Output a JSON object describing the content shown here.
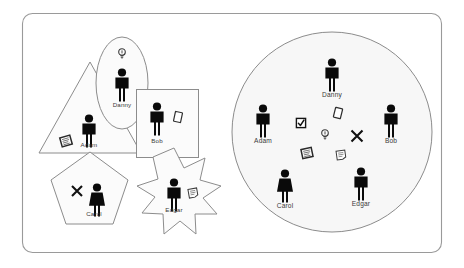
{
  "diagram": {
    "title": "",
    "type": "before-after-collaboration-diagram",
    "frame": {
      "shape": "rounded-rectangle",
      "stroke_color": "#9a9a9a",
      "fill_color": "#ffffff"
    },
    "palette": {
      "person_color": "#0a0a0a",
      "shape_fill": "#fbfbfb",
      "shape_stroke": "#8c8c8c",
      "circle_fill": "#f7f7f7",
      "label_color": "#3a3a3a"
    },
    "left_panel": {
      "name": "separate-silos",
      "description": "each person enclosed in their own distinct shape",
      "nodes": [
        {
          "label": "Adam",
          "shape": "triangle",
          "gender": "male",
          "artifact": "scribbled-note-icon"
        },
        {
          "label": "Danny",
          "shape": "ellipse",
          "gender": "male",
          "artifact": "lightbulb-icon"
        },
        {
          "label": "Bob",
          "shape": "rectangle",
          "gender": "male",
          "artifact": "blank-card-icon"
        },
        {
          "label": "Carol",
          "shape": "pentagon",
          "gender": "female",
          "artifact": "x-mark-icon"
        },
        {
          "label": "Edgar",
          "shape": "star",
          "gender": "male",
          "artifact": "folded-note-icon"
        }
      ]
    },
    "right_panel": {
      "name": "shared-circle",
      "description": "all people inside one common circle with artifacts pooled at the centre",
      "shape": "circle",
      "nodes": [
        {
          "label": "Danny",
          "gender": "male",
          "position": "top"
        },
        {
          "label": "Adam",
          "gender": "male",
          "position": "left"
        },
        {
          "label": "Bob",
          "gender": "male",
          "position": "right"
        },
        {
          "label": "Carol",
          "gender": "female",
          "position": "bottom-left"
        },
        {
          "label": "Edgar",
          "gender": "male",
          "position": "bottom-right"
        }
      ],
      "shared_artifacts": [
        "checked-checkbox-icon",
        "blank-card-icon",
        "lightbulb-icon",
        "x-mark-icon",
        "framed-note-icon",
        "folded-note-icon"
      ]
    }
  }
}
